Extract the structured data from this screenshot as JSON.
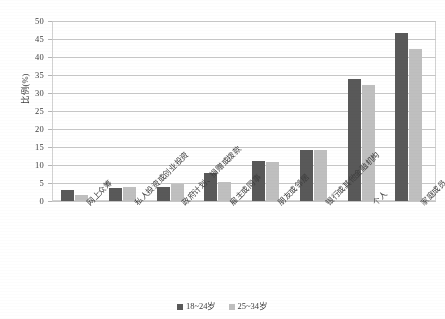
{
  "chart_data": {
    "type": "bar",
    "title": "",
    "xlabel": "",
    "ylabel": "比例(%)",
    "ylim": [
      0,
      50
    ],
    "ytick_step": 5,
    "yticks": [
      0,
      5,
      10,
      15,
      20,
      25,
      30,
      35,
      40,
      45,
      50
    ],
    "grid": "horizontal",
    "legend_position": "bottom-center",
    "categories": [
      "网上众筹",
      "私人投资或创业投资",
      "政府计划、捐赠或拨款",
      "雇主或同事",
      "朋友或邻居",
      "银行或其他金融机构",
      "个人",
      "家庭成员"
    ],
    "series": [
      {
        "name": "18~24岁",
        "color": "#595959",
        "values": [
          3.0,
          3.5,
          4.0,
          7.8,
          11.2,
          14.3,
          34.0,
          47.0
        ]
      },
      {
        "name": "25~34岁",
        "color": "#bfbfbf",
        "values": [
          1.7,
          4.0,
          4.8,
          5.2,
          11.0,
          14.3,
          32.5,
          42.5
        ]
      }
    ]
  },
  "axis": {
    "y_title": "比例(%)"
  },
  "colors": {
    "series_1": "#595959",
    "series_2": "#bfbfbf",
    "gridline": "#c9c9c9",
    "plot_border": "#d2d2d2",
    "text": "#3d3d3d"
  }
}
